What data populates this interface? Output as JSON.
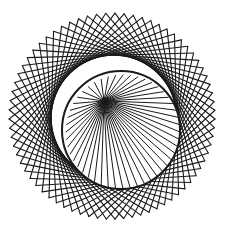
{
  "figure": {
    "background": "#ffffff",
    "stroke": "#1a1a1a",
    "outer_ring": {
      "cx": 115,
      "cy": 119,
      "r": 103,
      "points": 72,
      "skip": 21
    },
    "inner_fan": {
      "hub_x": 104,
      "hub_y": 101,
      "cx": 123,
      "cy": 132,
      "r": 57,
      "spokes": 48
    },
    "inner_rim": {
      "cx": 121,
      "cy": 130,
      "r": 59
    }
  }
}
